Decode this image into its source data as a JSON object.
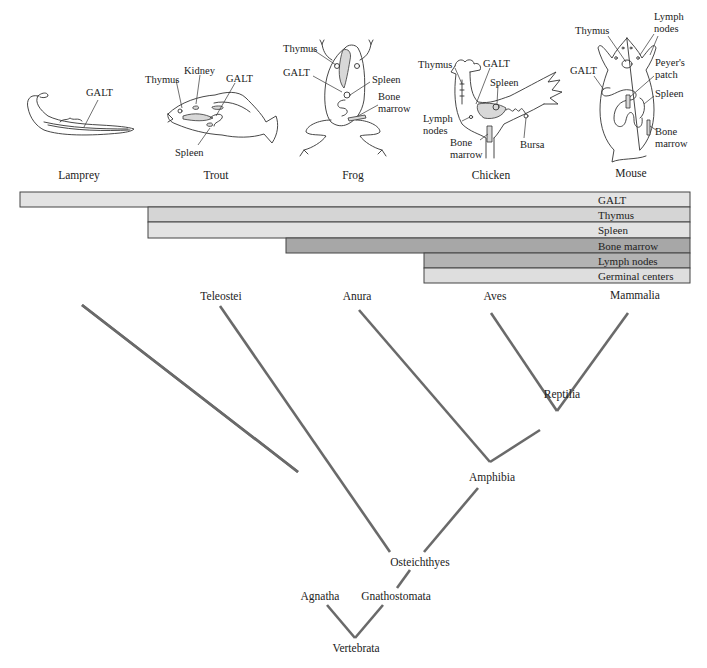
{
  "figure": {
    "animals": [
      {
        "name": "Lamprey",
        "organ_labels": [
          "GALT"
        ]
      },
      {
        "name": "Trout",
        "organ_labels": [
          "Thymus",
          "Kidney",
          "GALT",
          "Spleen"
        ]
      },
      {
        "name": "Frog",
        "organ_labels": [
          "Thymus",
          "GALT",
          "Spleen",
          "Bone",
          "marrow"
        ]
      },
      {
        "name": "Chicken",
        "organ_labels": [
          "Thymus",
          "GALT",
          "Spleen",
          "Lymph",
          "nodes",
          "Bone",
          "marrow",
          "Bursa"
        ]
      },
      {
        "name": "Mouse",
        "organ_labels": [
          "Thymus",
          "Lymph",
          "nodes",
          "GALT",
          "Peyer's",
          "patch",
          "Spleen",
          "Bone",
          "marrow"
        ]
      }
    ],
    "bars": [
      {
        "label": "GALT",
        "starts_at": "Lamprey",
        "color": "#e3e3e3"
      },
      {
        "label": "Thymus",
        "starts_at": "Trout",
        "color": "#d5d5d5"
      },
      {
        "label": "Spleen",
        "starts_at": "Trout",
        "color": "#e3e3e3"
      },
      {
        "label": "Bone marrow",
        "starts_at": "Frog",
        "color": "#a7a7a7"
      },
      {
        "label": "Lymph nodes",
        "starts_at": "Chicken",
        "color": "#b3b3b3"
      },
      {
        "label": "Germinal centers",
        "starts_at": "Chicken",
        "color": "#dedede"
      }
    ],
    "tree": {
      "leaves": [
        "Teleostei",
        "Anura",
        "Aves",
        "Mammalia"
      ],
      "nodes": {
        "reptilia": "Reptilia",
        "amphibia": "Amphibia",
        "osteichthyes": "Osteichthyes",
        "agnatha": "Agnatha",
        "gnathostomata": "Gnathostomata",
        "vertebrata": "Vertebrata"
      },
      "branch_color": "#6a6a6a"
    }
  }
}
